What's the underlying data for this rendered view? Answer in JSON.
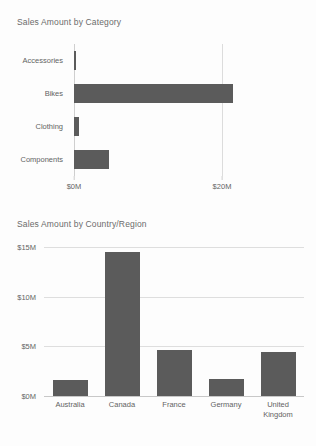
{
  "theme": {
    "background": "#fdfdfd",
    "bar_color": "#5b5b5b",
    "gridline_color": "#dedede",
    "axis_color": "#c8c8c8",
    "text_color": "#636363",
    "title_color": "#6b6b6b"
  },
  "charts": [
    {
      "id": "sales-by-category",
      "title": "Sales Amount by Category"
    },
    {
      "id": "sales-by-country-region",
      "title": "Sales Amount by Country/Region"
    }
  ],
  "chart_data": [
    {
      "type": "bar",
      "orientation": "horizontal",
      "title": "Sales Amount by Category",
      "xlabel": "",
      "ylabel": "",
      "categories": [
        "Accessories",
        "Bikes",
        "Clothing",
        "Components"
      ],
      "values": [
        0.3,
        21.5,
        0.7,
        4.7
      ],
      "value_unit": "$M",
      "xlim": [
        0,
        21.5
      ],
      "xticks": [
        0,
        20
      ],
      "xticklabels": [
        "$0M",
        "$20M"
      ],
      "grid": true,
      "legend": false,
      "series": [
        {
          "name": "Sales Amount",
          "values": [
            0.3,
            21.5,
            0.7,
            4.7
          ]
        }
      ]
    },
    {
      "type": "bar",
      "orientation": "vertical",
      "title": "Sales Amount by Country/Region",
      "xlabel": "",
      "ylabel": "",
      "categories": [
        "Australia",
        "Canada",
        "France",
        "Germany",
        "United Kingdom"
      ],
      "values": [
        1.6,
        14.5,
        4.6,
        1.7,
        4.4
      ],
      "value_unit": "$M",
      "ylim": [
        0,
        15
      ],
      "yticks": [
        0,
        5,
        10,
        15
      ],
      "yticklabels": [
        "$0M",
        "$5M",
        "$10M",
        "$15M"
      ],
      "grid": true,
      "legend": false,
      "series": [
        {
          "name": "Sales Amount",
          "values": [
            1.6,
            14.5,
            4.6,
            1.7,
            4.4
          ]
        }
      ]
    }
  ]
}
